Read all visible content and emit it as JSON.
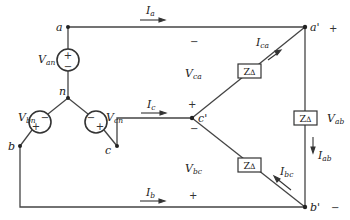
{
  "diagram": {
    "nodes": {
      "a": "a",
      "n": "n",
      "b": "b",
      "c": "c",
      "a_prime": "a'",
      "b_prime": "b'",
      "c_prime": "c'"
    },
    "sources": [
      {
        "name": "V",
        "sub": "an",
        "top_sign": "+",
        "bottom_sign": "−"
      },
      {
        "name": "V",
        "sub": "bn",
        "left_sign": "+",
        "right_sign": "−"
      },
      {
        "name": "V",
        "sub": "cn",
        "left_sign": "−",
        "right_sign": "+"
      }
    ],
    "line_currents": [
      {
        "name": "I",
        "sub": "a"
      },
      {
        "name": "I",
        "sub": "b"
      },
      {
        "name": "I",
        "sub": "c"
      }
    ],
    "phase_currents": [
      {
        "name": "I",
        "sub": "ca"
      },
      {
        "name": "I",
        "sub": "ab"
      },
      {
        "name": "I",
        "sub": "bc"
      }
    ],
    "impedances": [
      {
        "label": "Z",
        "sub": "Δ"
      },
      {
        "label": "Z",
        "sub": "Δ"
      },
      {
        "label": "Z",
        "sub": "Δ"
      }
    ],
    "voltages": [
      {
        "name": "V",
        "sub": "ca",
        "plus": "+",
        "minus": "−"
      },
      {
        "name": "V",
        "sub": "ab",
        "plus": "+",
        "minus": "−"
      },
      {
        "name": "V",
        "sub": "bc",
        "plus": "+",
        "minus": "−"
      }
    ],
    "colors": {
      "wire": "#444444",
      "text": "#222222",
      "background": "#ffffff"
    }
  }
}
